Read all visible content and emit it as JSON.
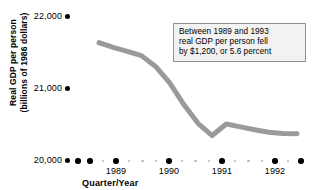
{
  "chart_data": {
    "type": "line",
    "title": "",
    "xlabel": "Quarter/Year",
    "ylabel": "Real GDP per person (billions of 1986 dollars)",
    "ylabel_lines": [
      "Real GDP per person",
      "(billions of 1986 dollars)"
    ],
    "ylim": [
      20000,
      22000
    ],
    "y_ticks": [
      20000,
      21000,
      22000
    ],
    "y_tick_labels": [
      "20,000",
      "21,000",
      "22,000"
    ],
    "grid": false,
    "legend": null,
    "x_year_labels": [
      "1989",
      "1990",
      "1991",
      "1992"
    ],
    "x": [
      "1989 Q1",
      "1989 Q2",
      "1989 Q3",
      "1989 Q4",
      "1990 Q1",
      "1990 Q2",
      "1990 Q3",
      "1990 Q4",
      "1991 Q1",
      "1991 Q2",
      "1991 Q3",
      "1991 Q4",
      "1992 Q1",
      "1992 Q2",
      "1992 Q3"
    ],
    "values": [
      21640,
      21575,
      21520,
      21460,
      21310,
      21080,
      20780,
      20520,
      20350,
      20510,
      20470,
      20430,
      20395,
      20380,
      20375
    ],
    "series_color": "#9a9a9a",
    "line_width": 5
  },
  "annotation": {
    "lines": [
      "Between 1989 and 1993",
      "real GDP per person fell",
      "by $1,200, or 5.6 percent"
    ],
    "border_color": "#8f8f8f",
    "background_color": "#f2f2f2"
  },
  "axis": {
    "tick_color": "#000000",
    "minor_tick_color": "#b9b9b9"
  }
}
